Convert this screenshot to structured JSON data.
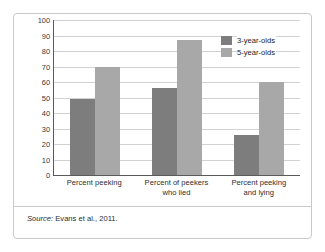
{
  "chart_data": {
    "type": "bar",
    "title": "",
    "subtitle": "",
    "xlabel": "",
    "ylabel": "",
    "ylim": [
      0,
      100
    ],
    "yticks": [
      0,
      10,
      20,
      30,
      40,
      50,
      60,
      70,
      80,
      90,
      100
    ],
    "grid": "horizontal",
    "legend_position": "top-right",
    "categories": [
      "Percent peeking",
      "Percent of peekers who lied",
      "Percent peeking and lying"
    ],
    "series": [
      {
        "name": "3-year-olds",
        "color": "#7d7d7d",
        "values": [
          49,
          56,
          26
        ]
      },
      {
        "name": "5-year-olds",
        "color": "#a8a8a8",
        "values": [
          70,
          87,
          60
        ]
      }
    ]
  },
  "axis": {
    "y_tick_labels": [
      "100",
      "90",
      "80",
      "70",
      "60",
      "50",
      "40",
      "30",
      "20",
      "10",
      "0"
    ]
  },
  "x_labels": [
    {
      "line1": "Percent peeking",
      "line2": ""
    },
    {
      "line1": "Percent of peekers",
      "line2": "who lied"
    },
    {
      "line1": "Percent peeking",
      "line2": "and lying"
    }
  ],
  "legend": {
    "items": [
      {
        "label": "3-year-olds"
      },
      {
        "label": "5-year-olds"
      }
    ]
  },
  "source": {
    "label": "Source:",
    "text": " Evans et al., 2011."
  },
  "colors": {
    "series_3_year_olds": "#7d7d7d",
    "series_5_year_olds": "#a8a8a8",
    "gridline": "#d2d2d2",
    "axis": "#5a5a5a",
    "frame": "#c9c9c9"
  }
}
